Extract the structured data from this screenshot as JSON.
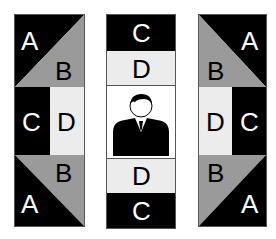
{
  "colors": {
    "black": "#000000",
    "gray": "#9a9a9a",
    "light": "#ececec",
    "white": "#ffffff"
  },
  "left_panel": {
    "top": {
      "upper_label": "A",
      "lower_label": "B"
    },
    "middle": {
      "left_label": "C",
      "right_label": "D"
    },
    "bottom": {
      "upper_label": "B",
      "lower_label": "A"
    }
  },
  "center_panel": {
    "top_label": "C",
    "second_label": "D",
    "figure": "person-icon",
    "fourth_label": "D",
    "bottom_label": "C"
  },
  "right_panel": {
    "top": {
      "upper_label": "A",
      "lower_label": "B"
    },
    "middle": {
      "left_label": "D",
      "right_label": "C"
    },
    "bottom": {
      "upper_label": "B",
      "lower_label": "A"
    }
  }
}
